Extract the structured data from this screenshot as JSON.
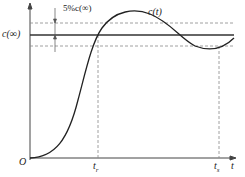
{
  "diagram": {
    "labels": {
      "band": "5%c(∞)",
      "curve": "c(t)",
      "steady": "c(∞)",
      "origin": "O",
      "rise_time": "t",
      "rise_sub": "r",
      "settle_time": "t",
      "settle_sub": "s",
      "t_axis": "t"
    }
  }
}
